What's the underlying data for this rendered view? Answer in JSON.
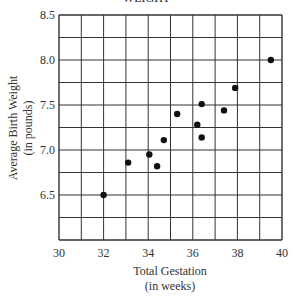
{
  "chart_data": {
    "type": "scatter",
    "title": "WEIGHT",
    "xlabel": "Total Gestation (in weeks)",
    "xlabel_lines": [
      "Total Gestation",
      "(in weeks)"
    ],
    "ylabel": "Average Birth Weight (in pounds)",
    "ylabel_lines": [
      "Average Birth Weight",
      "(in pounds)"
    ],
    "xlim": [
      30,
      40
    ],
    "ylim": [
      6.0,
      8.5
    ],
    "x_ticks": [
      "30",
      "32",
      "34",
      "36",
      "38",
      "40"
    ],
    "y_ticks": [
      "8.5",
      "8.0",
      "7.5",
      "7.0",
      "6.5"
    ],
    "grid": true,
    "points": [
      {
        "x": 32.0,
        "y": 6.5
      },
      {
        "x": 33.1,
        "y": 6.86
      },
      {
        "x": 34.05,
        "y": 6.95
      },
      {
        "x": 34.4,
        "y": 6.82
      },
      {
        "x": 34.7,
        "y": 7.11
      },
      {
        "x": 35.3,
        "y": 7.4
      },
      {
        "x": 36.2,
        "y": 7.28
      },
      {
        "x": 36.4,
        "y": 7.51
      },
      {
        "x": 36.4,
        "y": 7.14
      },
      {
        "x": 37.4,
        "y": 7.44
      },
      {
        "x": 37.9,
        "y": 7.69
      },
      {
        "x": 39.5,
        "y": 8.0
      }
    ]
  }
}
